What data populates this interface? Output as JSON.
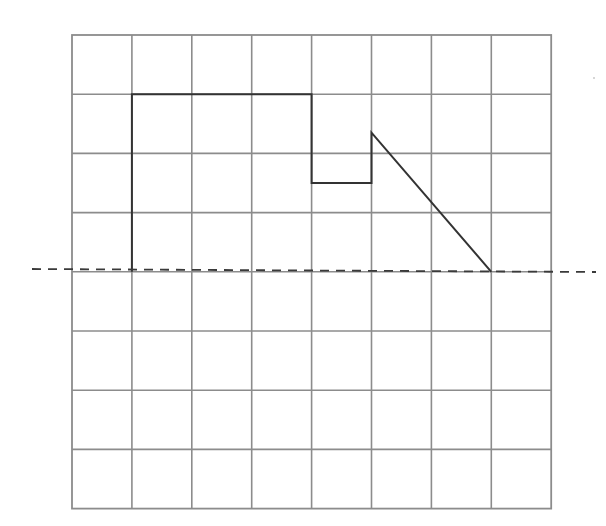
{
  "diagram": {
    "type": "grid-reflection-figure",
    "grid": {
      "columns": 8,
      "rows": 8,
      "origin_px": [
        72,
        35
      ],
      "cell_width_px": 59.9,
      "cell_height_px": 59.2,
      "line_color": "#8c8c8c"
    },
    "shape": {
      "description": "open polyline on upper half of grid",
      "color": "#333333",
      "vertices_grid": [
        [
          1,
          4
        ],
        [
          1,
          1
        ],
        [
          4,
          1
        ],
        [
          4,
          2.5
        ],
        [
          5,
          2.5
        ],
        [
          5,
          1.65
        ],
        [
          7,
          4
        ]
      ]
    },
    "mirror_line": {
      "style": "dashed",
      "color": "#3a3a3a",
      "grid_row": 4,
      "extends_beyond_grid": true,
      "start_px": [
        32,
        269
      ],
      "end_px": [
        596,
        272
      ]
    }
  }
}
